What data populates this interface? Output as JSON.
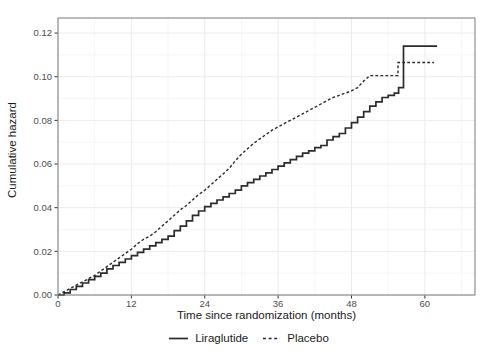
{
  "figure": {
    "background": "#ffffff",
    "panel_border_color": "#7a7a7a",
    "grid_major_color": "#ebebeb",
    "grid_minor_color": "#f6f6f6",
    "line_color": "#2b2b2b",
    "tick_color": "#333333",
    "tick_label_color": "#4d4d4d",
    "axis_title_color": "#1a1a1a"
  },
  "chart_data": {
    "type": "line",
    "title": "",
    "xlabel": "Time since randomization (months)",
    "ylabel": "Cumulative hazard",
    "x_ticks": [
      0,
      12,
      24,
      36,
      48,
      60
    ],
    "x_minor_ticks": [
      6,
      18,
      30,
      42,
      54,
      66
    ],
    "y_ticks": [
      "0.00",
      "0.02",
      "0.04",
      "0.06",
      "0.08",
      "0.10",
      "0.12"
    ],
    "y_minor_ticks": [
      0.01,
      0.03,
      0.05,
      0.07,
      0.09,
      0.11
    ],
    "xlim": [
      0,
      68.2
    ],
    "ylim": [
      0,
      0.1269
    ],
    "grid": "major-and-minor",
    "legend_position": "bottom",
    "series": [
      {
        "name": "Liraglutide",
        "style": "solid",
        "interpolation": "step",
        "points": [
          [
            0,
            0
          ],
          [
            1,
            0.001
          ],
          [
            2,
            0.0025
          ],
          [
            3,
            0.004
          ],
          [
            4,
            0.0055
          ],
          [
            5,
            0.007
          ],
          [
            6,
            0.0085
          ],
          [
            7,
            0.01
          ],
          [
            8,
            0.012
          ],
          [
            9,
            0.0135
          ],
          [
            10,
            0.015
          ],
          [
            11,
            0.0165
          ],
          [
            12,
            0.018
          ],
          [
            13,
            0.0195
          ],
          [
            14,
            0.021
          ],
          [
            15,
            0.0225
          ],
          [
            16,
            0.024
          ],
          [
            17,
            0.0255
          ],
          [
            18,
            0.027
          ],
          [
            19,
            0.0295
          ],
          [
            20,
            0.0315
          ],
          [
            21,
            0.034
          ],
          [
            22,
            0.0365
          ],
          [
            23,
            0.0385
          ],
          [
            24,
            0.0405
          ],
          [
            25,
            0.042
          ],
          [
            26,
            0.0435
          ],
          [
            27,
            0.045
          ],
          [
            28,
            0.0465
          ],
          [
            29,
            0.048
          ],
          [
            30,
            0.05
          ],
          [
            31,
            0.0515
          ],
          [
            32,
            0.053
          ],
          [
            33,
            0.0545
          ],
          [
            34,
            0.056
          ],
          [
            35,
            0.0575
          ],
          [
            36,
            0.059
          ],
          [
            37,
            0.0605
          ],
          [
            38,
            0.062
          ],
          [
            39,
            0.0635
          ],
          [
            40,
            0.065
          ],
          [
            41,
            0.066
          ],
          [
            42,
            0.0675
          ],
          [
            43,
            0.0685
          ],
          [
            44,
            0.071
          ],
          [
            45,
            0.0725
          ],
          [
            46,
            0.074
          ],
          [
            47,
            0.0765
          ],
          [
            48,
            0.079
          ],
          [
            49,
            0.0815
          ],
          [
            50,
            0.084
          ],
          [
            51,
            0.0865
          ],
          [
            52,
            0.0885
          ],
          [
            53,
            0.0905
          ],
          [
            54,
            0.0915
          ],
          [
            55,
            0.0925
          ],
          [
            55.7,
            0.095
          ],
          [
            56.5,
            0.114
          ],
          [
            62,
            0.114
          ]
        ]
      },
      {
        "name": "Placebo",
        "style": "dashed",
        "interpolation": "linear",
        "points": [
          [
            0,
            0
          ],
          [
            1,
            0.0015
          ],
          [
            2,
            0.003
          ],
          [
            3,
            0.0045
          ],
          [
            4,
            0.006
          ],
          [
            5,
            0.0075
          ],
          [
            6,
            0.009
          ],
          [
            7,
            0.011
          ],
          [
            8,
            0.013
          ],
          [
            9,
            0.015
          ],
          [
            10,
            0.017
          ],
          [
            11,
            0.019
          ],
          [
            12,
            0.021
          ],
          [
            13,
            0.0235
          ],
          [
            14,
            0.0255
          ],
          [
            15,
            0.027
          ],
          [
            16,
            0.029
          ],
          [
            17,
            0.0315
          ],
          [
            18,
            0.034
          ],
          [
            19,
            0.0365
          ],
          [
            20,
            0.039
          ],
          [
            21,
            0.041
          ],
          [
            22,
            0.0435
          ],
          [
            23,
            0.046
          ],
          [
            24,
            0.048
          ],
          [
            25,
            0.0505
          ],
          [
            26,
            0.053
          ],
          [
            27,
            0.0555
          ],
          [
            28,
            0.058
          ],
          [
            29,
            0.0615
          ],
          [
            30,
            0.0645
          ],
          [
            31,
            0.067
          ],
          [
            32,
            0.0695
          ],
          [
            33,
            0.0715
          ],
          [
            34,
            0.0735
          ],
          [
            35,
            0.0755
          ],
          [
            36,
            0.077
          ],
          [
            37,
            0.0785
          ],
          [
            38,
            0.08
          ],
          [
            39,
            0.0815
          ],
          [
            40,
            0.083
          ],
          [
            41,
            0.0845
          ],
          [
            42,
            0.086
          ],
          [
            43,
            0.0875
          ],
          [
            44,
            0.089
          ],
          [
            45,
            0.0905
          ],
          [
            46,
            0.0915
          ],
          [
            47,
            0.0925
          ],
          [
            48,
            0.0935
          ],
          [
            49,
            0.095
          ],
          [
            50,
            0.098
          ],
          [
            51,
            0.1005
          ],
          [
            55.6,
            0.1005
          ],
          [
            55.6,
            0.1065
          ],
          [
            61.5,
            0.1065
          ]
        ]
      }
    ]
  },
  "legend": {
    "items": [
      {
        "label": "Liraglutide",
        "line": "solid"
      },
      {
        "label": "Placebo",
        "line": "dashed"
      }
    ]
  }
}
